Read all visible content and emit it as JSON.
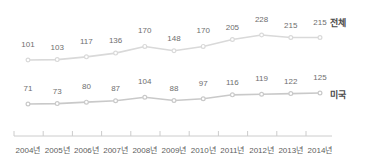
{
  "chart_data": {
    "type": "line",
    "title": "",
    "subtitle": "",
    "xlabel": "",
    "ylabel": "",
    "grid": false,
    "legend_position": "right-inline",
    "categories": [
      "2004년",
      "2005년",
      "2006년",
      "2007년",
      "2008년",
      "2009년",
      "2010년",
      "2011년",
      "2012년",
      "2013년",
      "2014년"
    ],
    "series": [
      {
        "name": "전체",
        "color": "#d9d9d9",
        "values": [
          101,
          103,
          117,
          136,
          170,
          148,
          170,
          205,
          228,
          215,
          215
        ]
      },
      {
        "name": "미국",
        "color": "#c9c9c9",
        "values": [
          71,
          73,
          80,
          87,
          104,
          88,
          97,
          116,
          119,
          122,
          125
        ]
      }
    ],
    "ylim": [
      0,
      260
    ],
    "axis_color": "#cccccc",
    "label_color": "#6e6e6e",
    "legend_text_color": "#4a4a4a"
  }
}
